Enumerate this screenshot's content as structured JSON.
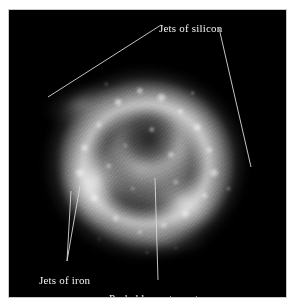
{
  "figure": {
    "plate_background": "#000000",
    "page_background": "#ffffff",
    "annotation_color": "#f2f2f2",
    "leader_color": "#d8d8d8"
  },
  "annotations": [
    {
      "id": "silicon",
      "label": "Jets of silicon",
      "position": {
        "left": 150,
        "top": 12
      },
      "leaders": [
        {
          "name": "leader-silicon-left",
          "x1": 160,
          "y1": 24,
          "x2": 47,
          "y2": 96
        },
        {
          "name": "leader-silicon-right",
          "x1": 218,
          "y1": 27,
          "x2": 250,
          "y2": 166
        }
      ]
    },
    {
      "id": "iron",
      "label": "Jets of iron",
      "position": {
        "left": 30,
        "top": 264
      },
      "leaders": [
        {
          "name": "leader-iron-upper",
          "x1": 66,
          "y1": 260,
          "x2": 79,
          "y2": 185
        },
        {
          "name": "leader-iron-lower",
          "x1": 66,
          "y1": 260,
          "x2": 70,
          "y2": 190
        }
      ]
    },
    {
      "id": "neutron-star",
      "label": "Probable nuetron star",
      "position": {
        "left": 100,
        "top": 282
      },
      "leaders": [
        {
          "name": "leader-neutron-star",
          "x1": 157,
          "y1": 279,
          "x2": 154,
          "y2": 177
        }
      ]
    }
  ]
}
